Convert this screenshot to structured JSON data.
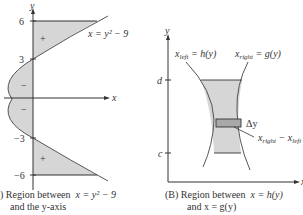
{
  "figure_a": {
    "axis_y_label": "y",
    "axis_x_label": "x",
    "ticks_y": [
      "6",
      "3",
      "−3",
      "−6"
    ],
    "curve_label": "x = y² − 9",
    "signs": [
      "+",
      "−",
      "−",
      "+"
    ],
    "caption_line1_prefix": ") Region between",
    "caption_line1_math": "x = y² − 9",
    "caption_line2": "and the y-axis"
  },
  "figure_b": {
    "axis_y_label": "y",
    "axis_x_label": "x",
    "ticks_y": [
      "d",
      "c"
    ],
    "left_curve_label": "x",
    "left_curve_sub": "left",
    "left_curve_eq": " = h(y)",
    "right_curve_label": "x",
    "right_curve_sub": "right",
    "right_curve_eq": " = g(y)",
    "strip_label": "Δy",
    "width_label_a": "x",
    "width_label_a_sub": "right",
    "width_label_minus": " − x",
    "width_label_b_sub": "left",
    "caption_line1_prefix": "(B)  Region between",
    "caption_line1_math": "x = h(y)",
    "caption_line2": "and x = g(y)"
  },
  "colors": {
    "shade": "#d6d6d6",
    "line": "#333333",
    "strip": "#a8a8a8"
  }
}
